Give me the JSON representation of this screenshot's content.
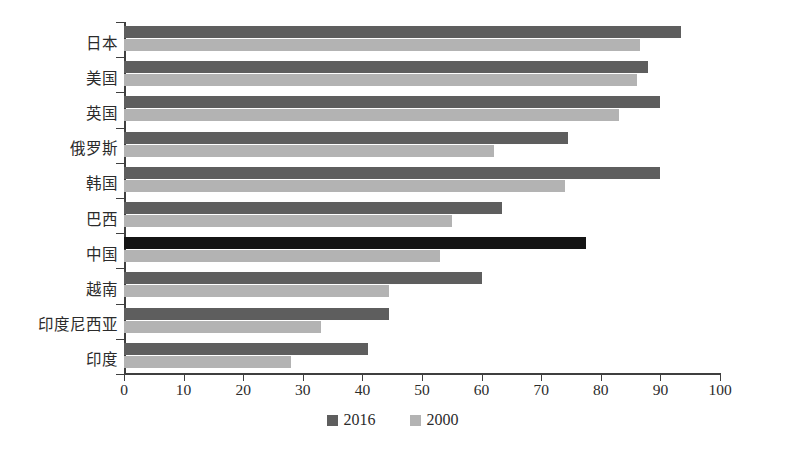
{
  "chart_data": {
    "type": "bar",
    "orientation": "horizontal",
    "title": "",
    "xlabel": "",
    "ylabel": "",
    "xlim": [
      0,
      100
    ],
    "xticks": [
      "0",
      "10",
      "20",
      "30",
      "40",
      "50",
      "60",
      "70",
      "80",
      "90",
      "100"
    ],
    "grid": false,
    "legend_position": "bottom-center",
    "categories": [
      "日本",
      "美国",
      "英国",
      "俄罗斯",
      "韩国",
      "巴西",
      "中国",
      "越南",
      "印度尼西亚",
      "印度"
    ],
    "series": [
      {
        "name": "2016",
        "color": "#5e5e5e",
        "values": [
          93.5,
          88.0,
          90.0,
          74.5,
          90.0,
          63.5,
          77.5,
          60.0,
          44.5,
          41.0
        ]
      },
      {
        "name": "2000",
        "color": "#b3b3b3",
        "values": [
          86.5,
          86.0,
          83.0,
          62.0,
          74.0,
          55.0,
          53.0,
          44.5,
          33.0,
          28.0
        ]
      }
    ],
    "highlight": {
      "category": "中国",
      "series": "2016",
      "color": "#141414"
    }
  },
  "legend": {
    "items": [
      {
        "label": "2016",
        "color": "#5e5e5e"
      },
      {
        "label": "2000",
        "color": "#b3b3b3"
      }
    ]
  },
  "axis": {
    "line_color": "#3f3f3f"
  }
}
